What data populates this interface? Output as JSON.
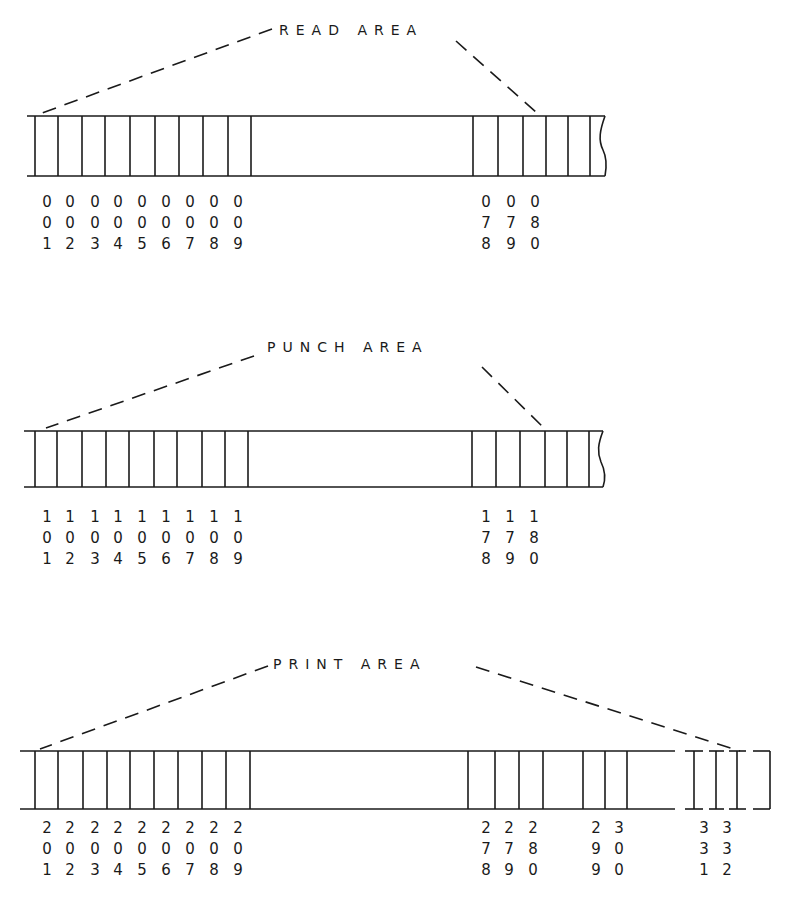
{
  "diagram": {
    "sections": [
      {
        "id": "read",
        "label": "READ AREA",
        "left_columns": [
          {
            "digits": [
              "0",
              "0",
              "1"
            ]
          },
          {
            "digits": [
              "0",
              "0",
              "2"
            ]
          },
          {
            "digits": [
              "0",
              "0",
              "3"
            ]
          },
          {
            "digits": [
              "0",
              "0",
              "4"
            ]
          },
          {
            "digits": [
              "0",
              "0",
              "5"
            ]
          },
          {
            "digits": [
              "0",
              "0",
              "6"
            ]
          },
          {
            "digits": [
              "0",
              "0",
              "7"
            ]
          },
          {
            "digits": [
              "0",
              "0",
              "8"
            ]
          },
          {
            "digits": [
              "0",
              "0",
              "9"
            ]
          }
        ],
        "right_columns": [
          {
            "digits": [
              "0",
              "7",
              "8"
            ]
          },
          {
            "digits": [
              "0",
              "7",
              "9"
            ]
          },
          {
            "digits": [
              "0",
              "8",
              "0"
            ]
          }
        ]
      },
      {
        "id": "punch",
        "label": "PUNCH AREA",
        "left_columns": [
          {
            "digits": [
              "1",
              "0",
              "1"
            ]
          },
          {
            "digits": [
              "1",
              "0",
              "2"
            ]
          },
          {
            "digits": [
              "1",
              "0",
              "3"
            ]
          },
          {
            "digits": [
              "1",
              "0",
              "4"
            ]
          },
          {
            "digits": [
              "1",
              "0",
              "5"
            ]
          },
          {
            "digits": [
              "1",
              "0",
              "6"
            ]
          },
          {
            "digits": [
              "1",
              "0",
              "7"
            ]
          },
          {
            "digits": [
              "1",
              "0",
              "8"
            ]
          },
          {
            "digits": [
              "1",
              "0",
              "9"
            ]
          }
        ],
        "right_columns": [
          {
            "digits": [
              "1",
              "7",
              "8"
            ]
          },
          {
            "digits": [
              "1",
              "7",
              "9"
            ]
          },
          {
            "digits": [
              "1",
              "8",
              "0"
            ]
          }
        ]
      },
      {
        "id": "print",
        "label": "PRINT AREA",
        "left_columns": [
          {
            "digits": [
              "2",
              "0",
              "1"
            ]
          },
          {
            "digits": [
              "2",
              "0",
              "2"
            ]
          },
          {
            "digits": [
              "2",
              "0",
              "3"
            ]
          },
          {
            "digits": [
              "2",
              "0",
              "4"
            ]
          },
          {
            "digits": [
              "2",
              "0",
              "5"
            ]
          },
          {
            "digits": [
              "2",
              "0",
              "6"
            ]
          },
          {
            "digits": [
              "2",
              "0",
              "7"
            ]
          },
          {
            "digits": [
              "2",
              "0",
              "8"
            ]
          },
          {
            "digits": [
              "2",
              "0",
              "9"
            ]
          }
        ],
        "mid_columns": [
          {
            "digits": [
              "2",
              "7",
              "8"
            ]
          },
          {
            "digits": [
              "2",
              "7",
              "9"
            ]
          },
          {
            "digits": [
              "2",
              "8",
              "0"
            ]
          }
        ],
        "mid2_columns": [
          {
            "digits": [
              "2",
              "9",
              "9"
            ]
          },
          {
            "digits": [
              "3",
              "0",
              "0"
            ]
          }
        ],
        "end_columns": [
          {
            "digits": [
              "3",
              "3",
              "1"
            ]
          },
          {
            "digits": [
              "3",
              "3",
              "2"
            ]
          }
        ]
      }
    ]
  }
}
